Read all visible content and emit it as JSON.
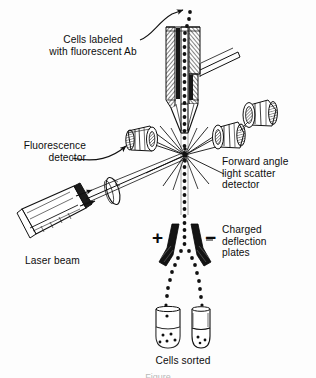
{
  "figure": {
    "background_color": "#fdfdfd",
    "ink_color": "#111111",
    "width": 316,
    "height": 378
  },
  "labels": {
    "cells_labeled": "Cells labeled\nwith fluorescent Ab",
    "fluorescence_detector": "Fluorescence\ndetector",
    "forward_scatter_detector": "Forward angle\nlight scatter\ndetector",
    "charged_plates": "Charged\ndeflection\nplates",
    "laser_beam": "Laser beam",
    "cells_sorted": "Cells sorted",
    "plate_positive": "+",
    "plate_negative": "−"
  },
  "caption": {
    "text": "Figure"
  },
  "parts": {
    "flow_cell": "flow-cell-nozzle",
    "sheath_inlet": "sheath-fluid-inlet-tube",
    "droplet_stream": "droplet-stream",
    "interrogation_point": "laser-interrogation-point",
    "laser": "laser-source",
    "laser_lens": "laser-focusing-lens",
    "detector_left": "fluorescence-detector-assembly",
    "detector_right_near": "forward-scatter-detector-assembly",
    "detector_right_far": "secondary-detector-assembly",
    "plate_left": "positive-deflection-plate",
    "plate_right": "negative-deflection-plate",
    "tube_left": "collection-tube-left",
    "tube_right": "collection-tube-right"
  }
}
